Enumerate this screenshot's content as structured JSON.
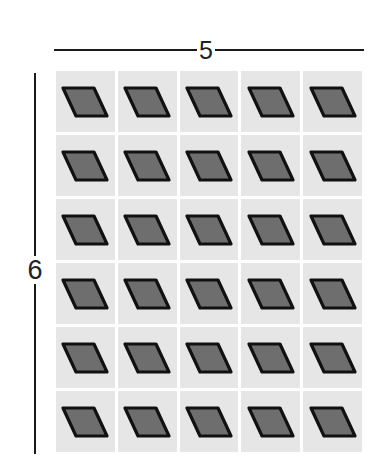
{
  "diagram": {
    "columns_label": "5",
    "rows_label": "6",
    "columns": 5,
    "rows": 6,
    "cell_shape": "parallelogram-icon",
    "colors": {
      "cell_background": "#e6e6e6",
      "shape_fill": "#6e6e6e",
      "shape_stroke": "#111111",
      "dimension_line": "#1a1a1a"
    }
  }
}
